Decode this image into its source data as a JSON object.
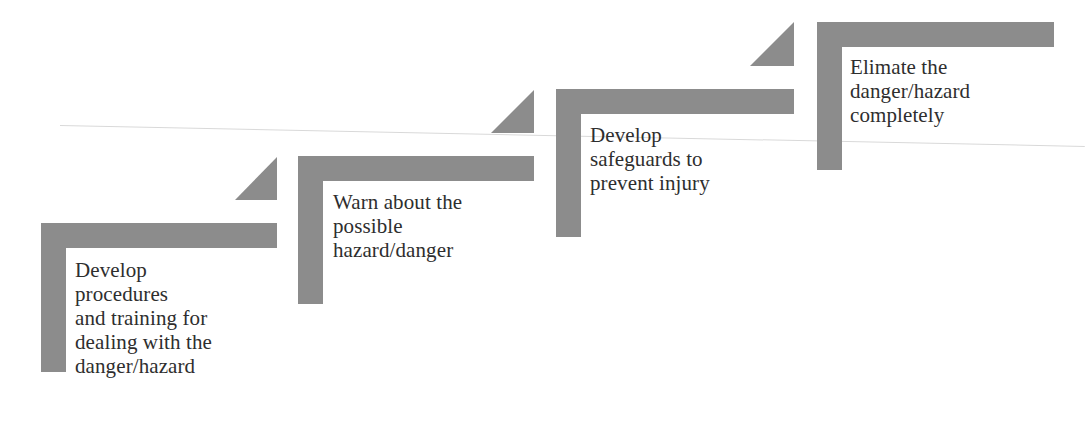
{
  "diagram": {
    "type": "staircase",
    "bar_color": "#8c8c8c",
    "text_color": "#2e2e2e",
    "steps": [
      {
        "id": "step-1",
        "label": "Develop\nprocedures\nand training for\ndealing with the\ndanger/hazard"
      },
      {
        "id": "step-2",
        "label": "Warn about the\npossible\nhazard/danger"
      },
      {
        "id": "step-3",
        "label": "Develop\nsafeguards to\nprevent injury"
      },
      {
        "id": "step-4",
        "label": "Elimate the\ndanger/hazard\ncompletely"
      }
    ]
  }
}
